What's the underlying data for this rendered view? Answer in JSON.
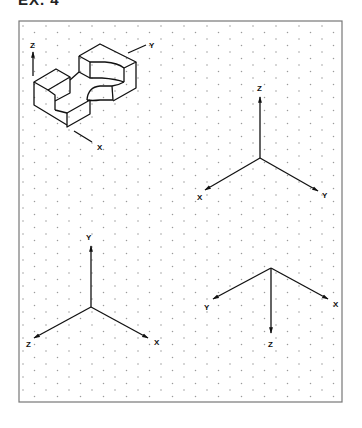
{
  "title": "EX. 4",
  "sheet": {
    "frame": {
      "x": 19,
      "y": 21,
      "width": 323,
      "height": 381,
      "stroke": "#777777"
    },
    "grid": {
      "type": "isometric-dot",
      "col_spacing": 11.5,
      "row_spacing": 13,
      "dot_color": "#9a9a9a"
    }
  },
  "object": {
    "name": "isometric-part",
    "axis_labels": {
      "z": "Z",
      "y": "Y",
      "x": "X"
    }
  },
  "axis_sets": [
    {
      "name": "axes-top-right",
      "origin": [
        260,
        158
      ],
      "arms": [
        {
          "axis": "z",
          "label": "Z",
          "end": [
            260,
            97
          ],
          "label_pos": [
            257,
            91
          ]
        },
        {
          "axis": "x",
          "label": "X",
          "end": [
            205,
            190
          ],
          "label_pos": [
            197,
            200
          ]
        },
        {
          "axis": "y",
          "label": "Y",
          "end": [
            318,
            191
          ],
          "label_pos": [
            322,
            198
          ]
        }
      ]
    },
    {
      "name": "axes-bottom-left",
      "origin": [
        91,
        307
      ],
      "arms": [
        {
          "axis": "y",
          "label": "Y",
          "end": [
            91,
            246
          ],
          "label_pos": [
            86,
            240
          ]
        },
        {
          "axis": "z",
          "label": "Z",
          "end": [
            34,
            338
          ],
          "label_pos": [
            26,
            347
          ]
        },
        {
          "axis": "x",
          "label": "X",
          "end": [
            148,
            338
          ],
          "label_pos": [
            154,
            345
          ]
        }
      ]
    },
    {
      "name": "axes-bottom-right",
      "origin": [
        271,
        268
      ],
      "arms": [
        {
          "axis": "y",
          "label": "Y",
          "end": [
            213,
            299
          ],
          "label_pos": [
            204,
            310
          ]
        },
        {
          "axis": "x",
          "label": "X",
          "end": [
            328,
            299
          ],
          "label_pos": [
            333,
            307
          ]
        },
        {
          "axis": "z",
          "label": "Z",
          "end": [
            271,
            333
          ],
          "label_pos": [
            268,
            347
          ]
        }
      ]
    }
  ]
}
